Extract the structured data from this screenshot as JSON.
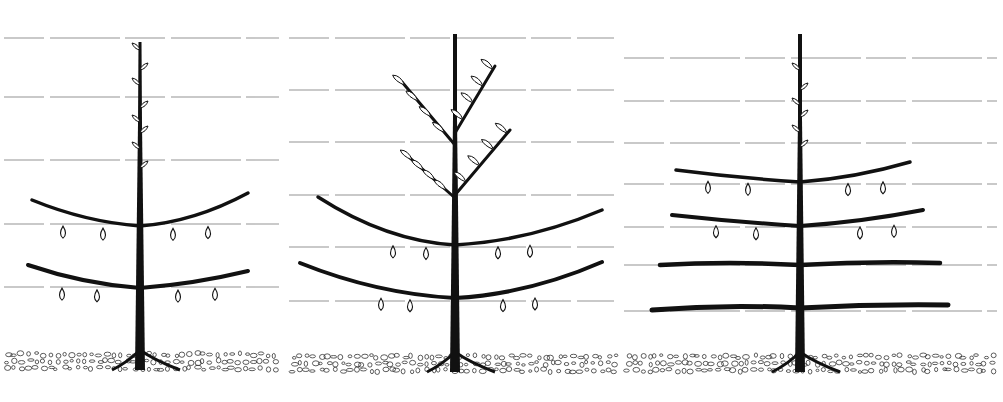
{
  "figure": {
    "colors": {
      "ink": "#111111",
      "wire": "#b8b8b8",
      "background": "#ffffff",
      "soil": "#333333"
    },
    "panels": [
      {
        "id": "stage-1",
        "x": 0,
        "width": 285,
        "trunk": {
          "x": 140,
          "top": 42,
          "base": 370
        },
        "wires": [
          38,
          97,
          160,
          224,
          287
        ],
        "tiers": [
          {
            "y": 226,
            "left": [
              32,
              200
            ],
            "right": [
              248,
              193
            ],
            "fruits": [
              63,
              103,
              173,
              208
            ]
          },
          {
            "y": 288,
            "left": [
              28,
              265
            ],
            "right": [
              248,
              271
            ],
            "fruits": [
              62,
              97,
              178,
              215
            ]
          }
        ],
        "leader_buds": [
          50,
          70,
          85,
          108,
          122,
          133,
          149,
          168
        ],
        "soil": {
          "top": 350,
          "bottom": 372
        }
      },
      {
        "id": "stage-2",
        "x": 285,
        "width": 335,
        "trunk": {
          "x": 170,
          "top": 34,
          "base": 372
        },
        "wires": [
          38,
          90,
          142,
          195,
          247,
          301
        ],
        "tiers": [
          {
            "y": 245,
            "left": [
              33,
              197
            ],
            "right": [
              317,
              210
            ],
            "fruits": [
              108,
              141,
              213,
              245
            ]
          },
          {
            "y": 298,
            "left": [
              15,
              263
            ],
            "right": [
              317,
              262
            ],
            "fruits": [
              96,
              125,
              218,
              250
            ]
          }
        ],
        "upper_branches": [
          {
            "from": [
              170,
              145
            ],
            "to": [
              117,
              82
            ]
          },
          {
            "from": [
              170,
              133
            ],
            "to": [
              210,
              66
            ]
          },
          {
            "from": [
              170,
              198
            ],
            "to": [
              125,
              158
            ]
          },
          {
            "from": [
              170,
              195
            ],
            "to": [
              225,
              130
            ]
          }
        ],
        "soil": {
          "top": 352,
          "bottom": 374
        }
      },
      {
        "id": "stage-3",
        "x": 620,
        "width": 383,
        "trunk": {
          "x": 180,
          "top": 34,
          "base": 372
        },
        "wires": [
          58,
          101,
          143,
          184,
          227,
          265,
          311
        ],
        "tiers": [
          {
            "y": 182,
            "left": [
              56,
              170
            ],
            "right": [
              290,
              162
            ],
            "fruits": [
              88,
              128,
              228,
              263
            ]
          },
          {
            "y": 226,
            "left": [
              52,
              215
            ],
            "right": [
              303,
              210
            ],
            "fruits": [
              96,
              136,
              240,
              274
            ]
          },
          {
            "y": 265,
            "left": [
              40,
              265
            ],
            "right": [
              320,
              263
            ],
            "fruits": []
          },
          {
            "y": 308,
            "left": [
              32,
              310
            ],
            "right": [
              328,
              305
            ],
            "fruits": []
          }
        ],
        "leader_buds": [
          70,
          90,
          105,
          117,
          132,
          147
        ],
        "soil": {
          "top": 352,
          "bottom": 374
        }
      }
    ]
  }
}
